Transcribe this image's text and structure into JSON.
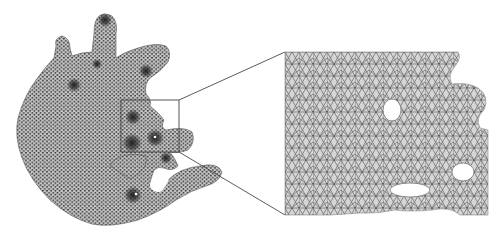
{
  "figure": {
    "overview": {
      "label": "full-mesh",
      "fill_color": "#c8c8c8",
      "node_color": "#3a3a3a",
      "refinement_spots": [
        {
          "x": 105,
          "y": 20,
          "r": 7
        },
        {
          "x": 97,
          "y": 64,
          "r": 5
        },
        {
          "x": 146,
          "y": 71,
          "r": 7
        },
        {
          "x": 74,
          "y": 85,
          "r": 7
        },
        {
          "x": 133,
          "y": 117,
          "r": 8
        },
        {
          "x": 132,
          "y": 143,
          "r": 10
        },
        {
          "x": 155,
          "y": 138,
          "r": 9
        },
        {
          "x": 166,
          "y": 158,
          "r": 6
        },
        {
          "x": 133,
          "y": 195,
          "r": 9
        }
      ]
    },
    "source_box": {
      "x": 121,
      "y": 100,
      "width": 58,
      "height": 52
    },
    "inset": {
      "label": "zoomed-mesh",
      "x": 285,
      "y": 52,
      "width": 203,
      "height": 163,
      "fill_color": "#d4d4d4",
      "edge_color": "#6e6e6e",
      "holes": [
        {
          "cx": 392,
          "cy": 110,
          "rx": 9,
          "ry": 11
        },
        {
          "cx": 463,
          "cy": 172,
          "rx": 11,
          "ry": 9
        },
        {
          "cx": 410,
          "cy": 190,
          "rx": 20,
          "ry": 7
        }
      ]
    },
    "connector_color": "#4a4a4a"
  }
}
